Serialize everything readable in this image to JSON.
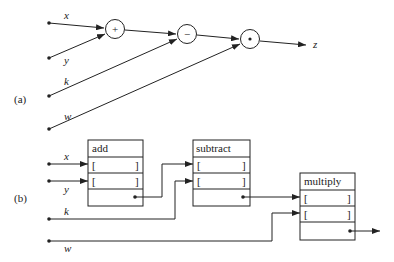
{
  "part_a": {
    "label": "(a)",
    "inputs": [
      "x",
      "y",
      "k",
      "w"
    ],
    "nodes": [
      {
        "symbol": "+",
        "name": "add"
      },
      {
        "symbol": "−",
        "name": "subtract"
      },
      {
        "symbol": "•",
        "name": "multiply"
      }
    ],
    "output": "z"
  },
  "part_b": {
    "label": "(b)",
    "inputs": [
      "x",
      "y",
      "k",
      "w"
    ],
    "boxes": [
      {
        "title": "add",
        "slot_open": "[",
        "slot_close": "]"
      },
      {
        "title": "subtract",
        "slot_open": "[",
        "slot_close": "]"
      },
      {
        "title": "multiply",
        "slot_open": "[",
        "slot_close": "]"
      }
    ]
  }
}
